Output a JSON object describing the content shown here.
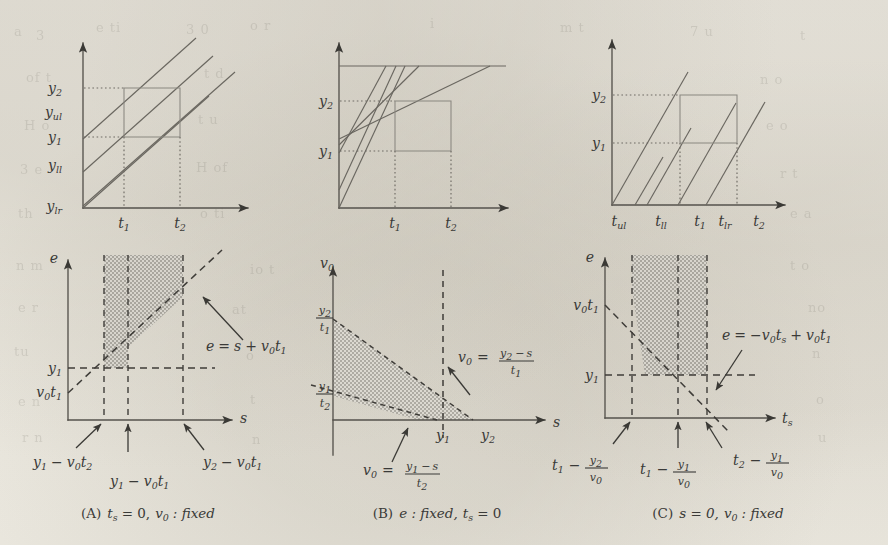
{
  "figure": {
    "kind": "multi-panel-math-figure",
    "panel_count": 6,
    "background_hex": "#efece4",
    "ink_hex": "#3a3a38"
  },
  "panels": {
    "top_left": {
      "name": "ray-family-y-axis",
      "x_axis_label": "",
      "y_tick_labels": [
        "y2",
        "yul",
        "y1",
        "yll",
        "ylr"
      ],
      "y_tick_sub": [
        "2",
        "ul",
        "1",
        "ll",
        "lr"
      ],
      "y_tick_base": [
        "y",
        "y",
        "y",
        "y",
        "y"
      ],
      "x_tick_labels": [
        "t1",
        "t2"
      ],
      "x_tick_base": [
        "t",
        "t"
      ],
      "x_tick_sub": [
        "1",
        "2"
      ],
      "ray_count": 4,
      "box": "rectangle from (t1,y1) to (t2,y2)"
    },
    "top_middle": {
      "name": "ray-fan-saturating",
      "y_tick_labels": [
        "y2",
        "y1"
      ],
      "y_tick_base": [
        "y",
        "y"
      ],
      "y_tick_sub": [
        "2",
        "1"
      ],
      "x_tick_labels": [
        "t1",
        "t2"
      ],
      "x_tick_base": [
        "t",
        "t"
      ],
      "x_tick_sub": [
        "1",
        "2"
      ],
      "ray_count": 5,
      "has_saturation_line": true,
      "box": "rectangle from (t1,y1) to (t2,y2)"
    },
    "top_right": {
      "name": "ray-family-t-axis",
      "y_tick_labels": [
        "y2",
        "y1"
      ],
      "y_tick_base": [
        "y",
        "y"
      ],
      "y_tick_sub": [
        "2",
        "1"
      ],
      "x_tick_labels": [
        "tul",
        "tll",
        "t1",
        "tlr",
        "t2"
      ],
      "x_tick_base": [
        "t",
        "t",
        "t",
        "t",
        "t"
      ],
      "x_tick_sub": [
        "ul",
        "ll",
        "1",
        "lr",
        "2"
      ],
      "ray_count": 5,
      "box": "rectangle from (t1,y1) to (t2,y2)"
    },
    "bottom_left": {
      "name": "feasible-region-A",
      "y_axis_label": "e",
      "x_axis_label": "s",
      "y_tick_labels": [
        "y1",
        "v0t1"
      ],
      "boundary_equation": "e = s + v0t1",
      "x_annotations": [
        "y1 - v0t2",
        "y1 - v0t1",
        "y2 - v0t1"
      ],
      "caption": "(A)  ts = 0, v0 : fixed",
      "caption_parts": {
        "tag": "(A)",
        "expr1_base": "t",
        "expr1_sub": "s",
        "expr1_rhs": "= 0,",
        "expr2_base": "v",
        "expr2_sub": "0",
        "expr2_rhs": ": fixed"
      }
    },
    "bottom_middle": {
      "name": "feasible-region-B",
      "y_axis_label": "v0",
      "x_axis_label": "s",
      "y_tick_labels": [
        "y2/t1",
        "y1/t2"
      ],
      "y_tick_fracs": [
        {
          "num_base": "y",
          "num_sub": "2",
          "den_base": "t",
          "den_sub": "1"
        },
        {
          "num_base": "y",
          "num_sub": "1",
          "den_base": "t",
          "den_sub": "2"
        }
      ],
      "x_tick_labels": [
        "y1",
        "y2"
      ],
      "upper_boundary_equation": "v0 = (y2 - s) / t1",
      "lower_boundary_equation": "v0 = (y1 - s) / t2",
      "caption": "(B)  e : fixed, ts = 0",
      "caption_parts": {
        "tag": "(B)",
        "expr1": "e : fixed,",
        "expr2_base": "t",
        "expr2_sub": "s",
        "expr2_rhs": "= 0"
      }
    },
    "bottom_right": {
      "name": "feasible-region-C",
      "y_axis_label": "e",
      "x_axis_label": "ts",
      "x_axis_base": "t",
      "x_axis_sub": "s",
      "y_tick_labels": [
        "v0t1",
        "y1"
      ],
      "boundary_equation": "e = -v0ts + v0t1",
      "x_annotations": [
        "t1 - y2/v0",
        "t1 - y1/v0",
        "t2 - y1/v0"
      ],
      "caption": "(C)  s = 0, v0 : fixed",
      "caption_parts": {
        "tag": "(C)",
        "expr1": "s = 0,",
        "expr2_base": "v",
        "expr2_sub": "0",
        "expr2_rhs": ": fixed"
      }
    }
  },
  "symbols": {
    "y": "y",
    "t": "t",
    "v": "v",
    "e": "e",
    "s": "s",
    "eq": "=",
    "plus": "+",
    "minus": "−",
    "colon": ":",
    "zero": "0",
    "one": "1",
    "two": "2",
    "sub_s": "s",
    "sub_ul": "ul",
    "sub_ll": "ll",
    "sub_lr": "lr",
    "fixed": "fixed",
    "comma": ","
  },
  "ghost_text": [
    {
      "t": "a",
      "x": 14,
      "y": 24
    },
    {
      "t": "3",
      "x": 36,
      "y": 28
    },
    {
      "t": "e ti",
      "x": 96,
      "y": 20
    },
    {
      "t": "3 0",
      "x": 186,
      "y": 22
    },
    {
      "t": "o r",
      "x": 250,
      "y": 18
    },
    {
      "t": "i",
      "x": 430,
      "y": 16
    },
    {
      "t": "m t",
      "x": 560,
      "y": 20
    },
    {
      "t": "7 u",
      "x": 690,
      "y": 24
    },
    {
      "t": "t",
      "x": 800,
      "y": 28
    },
    {
      "t": "of t",
      "x": 26,
      "y": 70
    },
    {
      "t": "t d",
      "x": 204,
      "y": 66
    },
    {
      "t": "n o",
      "x": 760,
      "y": 72
    },
    {
      "t": "H o",
      "x": 24,
      "y": 118
    },
    {
      "t": "t u",
      "x": 198,
      "y": 112
    },
    {
      "t": "e o",
      "x": 766,
      "y": 118
    },
    {
      "t": "3 e",
      "x": 20,
      "y": 162
    },
    {
      "t": "H of",
      "x": 196,
      "y": 160
    },
    {
      "t": "r t",
      "x": 780,
      "y": 166
    },
    {
      "t": "th",
      "x": 18,
      "y": 206
    },
    {
      "t": "o ti",
      "x": 200,
      "y": 206
    },
    {
      "t": "e a",
      "x": 790,
      "y": 206
    },
    {
      "t": "n m",
      "x": 16,
      "y": 258
    },
    {
      "t": "io t",
      "x": 250,
      "y": 262
    },
    {
      "t": "t o",
      "x": 790,
      "y": 258
    },
    {
      "t": "e r",
      "x": 18,
      "y": 300
    },
    {
      "t": "at",
      "x": 232,
      "y": 302
    },
    {
      "t": "no",
      "x": 808,
      "y": 300
    },
    {
      "t": "tu",
      "x": 14,
      "y": 344
    },
    {
      "t": "o",
      "x": 246,
      "y": 348
    },
    {
      "t": "n",
      "x": 812,
      "y": 346
    },
    {
      "t": "e n",
      "x": 18,
      "y": 394
    },
    {
      "t": "t",
      "x": 250,
      "y": 392
    },
    {
      "t": "o",
      "x": 816,
      "y": 392
    },
    {
      "t": "r n",
      "x": 22,
      "y": 430
    },
    {
      "t": "n",
      "x": 252,
      "y": 432
    },
    {
      "t": "u",
      "x": 818,
      "y": 430
    }
  ]
}
